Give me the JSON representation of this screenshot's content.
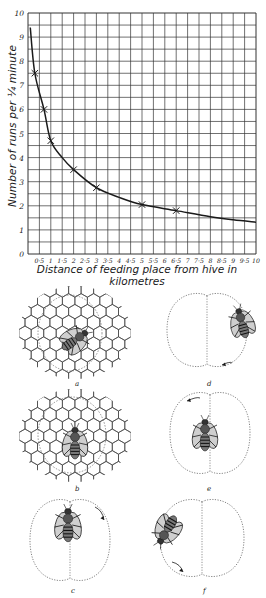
{
  "chart_data": {
    "type": "line",
    "title": "",
    "xlabel": "Distance of feeding place from hive in kilometres",
    "ylabel": "Number of runs per ¼ minute",
    "xlim": [
      0,
      10
    ],
    "ylim": [
      0,
      10
    ],
    "grid": true,
    "x_ticks": [
      "0.5",
      "1",
      "1.5",
      "2",
      "2.5",
      "3",
      "3.5",
      "4",
      "4.5",
      "5",
      "5.5",
      "6",
      "6.5",
      "7",
      "7.5",
      "8",
      "8.5",
      "9",
      "9.5",
      "10"
    ],
    "x_tick_labels": [
      "0·5",
      "1",
      "1·5",
      "2",
      "2·5",
      "3",
      "3·5",
      "4",
      "4·5",
      "5",
      "5·5",
      "6",
      "6·5",
      "7",
      "7·5",
      "8",
      "8·5",
      "9",
      "9·5",
      "10"
    ],
    "y_ticks": [
      "0",
      "1",
      "2",
      "3",
      "4",
      "5",
      "6",
      "7",
      "8",
      "9",
      "10"
    ],
    "series": [
      {
        "name": "observed",
        "marker": "x",
        "x": [
          0.3,
          0.7,
          1.0,
          2.0,
          3.0,
          5.0,
          6.5
        ],
        "y": [
          7.5,
          6.0,
          4.7,
          3.5,
          2.75,
          2.05,
          1.8
        ]
      },
      {
        "name": "fitted curve",
        "marker": "none",
        "x": [
          0.1,
          0.3,
          0.7,
          1.0,
          1.5,
          2.0,
          3.0,
          4.0,
          5.0,
          6.5,
          8.0,
          9.0,
          10.0
        ],
        "y": [
          9.4,
          7.5,
          6.0,
          4.7,
          4.0,
          3.5,
          2.75,
          2.35,
          2.05,
          1.8,
          1.55,
          1.42,
          1.32
        ]
      }
    ],
    "legend": null
  },
  "figures": {
    "panels": [
      {
        "label": "a",
        "type": "honeycomb",
        "description": "bee dancing on comb"
      },
      {
        "label": "b",
        "type": "honeycomb",
        "description": "bee dancing on comb"
      },
      {
        "label": "c",
        "type": "dance-figure",
        "description": "waggle dance loop, arrow clockwise"
      },
      {
        "label": "d",
        "type": "dance-figure",
        "description": "waggle dance loop, arrow at bottom"
      },
      {
        "label": "e",
        "type": "dance-figure",
        "description": "waggle dance loop, arrow at top-left"
      },
      {
        "label": "f",
        "type": "dance-figure",
        "description": "waggle dance loop, arrow at bottom"
      }
    ]
  },
  "colors": {
    "ink": "#1a1a1a",
    "grid": "#333333",
    "dotted": "#777777",
    "background": "#ffffff"
  }
}
